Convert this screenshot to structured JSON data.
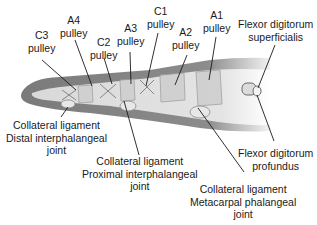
{
  "diagram": {
    "labels": [
      {
        "id": "c3",
        "lines": [
          "C3",
          "pulley"
        ]
      },
      {
        "id": "a4",
        "lines": [
          "A4",
          "pulley"
        ]
      },
      {
        "id": "c2",
        "lines": [
          "C2",
          "pulley"
        ]
      },
      {
        "id": "a3",
        "lines": [
          "A3",
          "pulley"
        ]
      },
      {
        "id": "c1",
        "lines": [
          "C1",
          "pulley"
        ]
      },
      {
        "id": "a2",
        "lines": [
          "A2",
          "pulley"
        ]
      },
      {
        "id": "a1",
        "lines": [
          "A1",
          "pulley"
        ]
      },
      {
        "id": "fds",
        "lines": [
          "Flexor digitorum",
          "superficialis"
        ]
      },
      {
        "id": "cl_dip",
        "lines": [
          "Collateral ligament",
          "Distal interphalangeal",
          "joint"
        ]
      },
      {
        "id": "cl_pip",
        "lines": [
          "Collateral ligament",
          "Proximal interphalangeal",
          "joint"
        ]
      },
      {
        "id": "fdp",
        "lines": [
          "Flexor digitorum",
          "profundus"
        ]
      },
      {
        "id": "cl_mcp",
        "lines": [
          "Collateral ligament",
          "Metacarpal phalangeal",
          "joint"
        ]
      }
    ]
  }
}
